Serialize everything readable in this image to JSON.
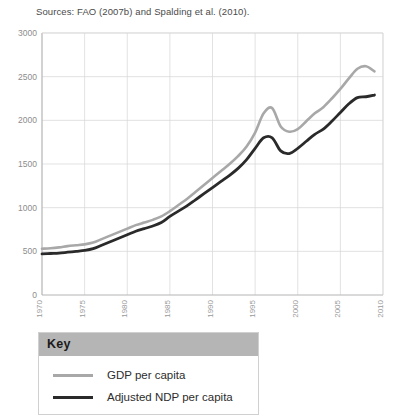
{
  "source_note": "Sources: FAO (2007b) and Spalding et al. (2010).",
  "legend": {
    "title": "Key",
    "items": [
      {
        "label": "GDP per capita",
        "color": "#a8a8a8"
      },
      {
        "label": "Adjusted NDP per capita",
        "color": "#2a2a2a"
      }
    ]
  },
  "chart_data": {
    "type": "line",
    "title": "",
    "subtitle": "",
    "xlabel": "",
    "ylabel": "",
    "xlim": [
      1970,
      2010
    ],
    "ylim": [
      0,
      3000
    ],
    "grid": true,
    "legend_position": "below-plot",
    "x_ticks": [
      "1970",
      "1975",
      "1980",
      "1985",
      "1990",
      "1995",
      "2000",
      "2005",
      "2010"
    ],
    "x_tick_values": [
      1970,
      1975,
      1980,
      1985,
      1990,
      1995,
      2000,
      2005,
      2010
    ],
    "y_ticks": [
      "0",
      "500",
      "1000",
      "1500",
      "2000",
      "2500",
      "3000"
    ],
    "y_tick_values": [
      0,
      500,
      1000,
      1500,
      2000,
      2500,
      3000
    ],
    "x": [
      1970,
      1971,
      1972,
      1973,
      1974,
      1975,
      1976,
      1977,
      1978,
      1979,
      1980,
      1981,
      1982,
      1983,
      1984,
      1985,
      1986,
      1987,
      1988,
      1989,
      1990,
      1991,
      1992,
      1993,
      1994,
      1995,
      1996,
      1997,
      1998,
      1999,
      2000,
      2001,
      2002,
      2003,
      2004,
      2005,
      2006,
      2007,
      2008,
      2009
    ],
    "series": [
      {
        "name": "GDP per capita",
        "color": "#a8a8a8",
        "values": [
          530,
          535,
          545,
          560,
          570,
          580,
          600,
          640,
          680,
          720,
          760,
          800,
          830,
          860,
          900,
          960,
          1030,
          1100,
          1180,
          1260,
          1340,
          1420,
          1500,
          1590,
          1700,
          1860,
          2080,
          2140,
          1930,
          1870,
          1900,
          1990,
          2080,
          2150,
          2250,
          2360,
          2480,
          2590,
          2620,
          2560
        ]
      },
      {
        "name": "Adjusted NDP per capita",
        "color": "#2a2a2a",
        "values": [
          470,
          475,
          480,
          490,
          500,
          510,
          530,
          570,
          610,
          650,
          690,
          730,
          760,
          790,
          830,
          900,
          960,
          1020,
          1090,
          1160,
          1230,
          1300,
          1370,
          1450,
          1550,
          1680,
          1800,
          1800,
          1650,
          1620,
          1680,
          1760,
          1840,
          1900,
          1990,
          2090,
          2190,
          2260,
          2270,
          2290
        ]
      }
    ]
  }
}
